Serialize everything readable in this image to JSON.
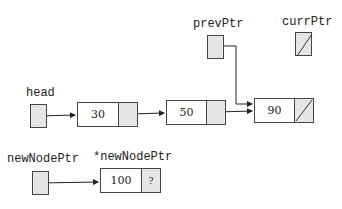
{
  "labels": {
    "head": "head",
    "prevPtr": "prevPtr",
    "currPtr": "currPtr",
    "newNodePtr": "newNodePtr",
    "derefNewNodePtr": "*newNodePtr"
  },
  "nodes": [
    {
      "value": "30",
      "next": "pointer"
    },
    {
      "value": "50",
      "next": "pointer"
    },
    {
      "value": "90",
      "next": "null"
    }
  ],
  "new_node": {
    "value": "100",
    "next": "?"
  },
  "pointers": {
    "head": "node-30",
    "prevPtr": "node-90",
    "currPtr": "null",
    "newNodePtr": "new-node-100"
  }
}
